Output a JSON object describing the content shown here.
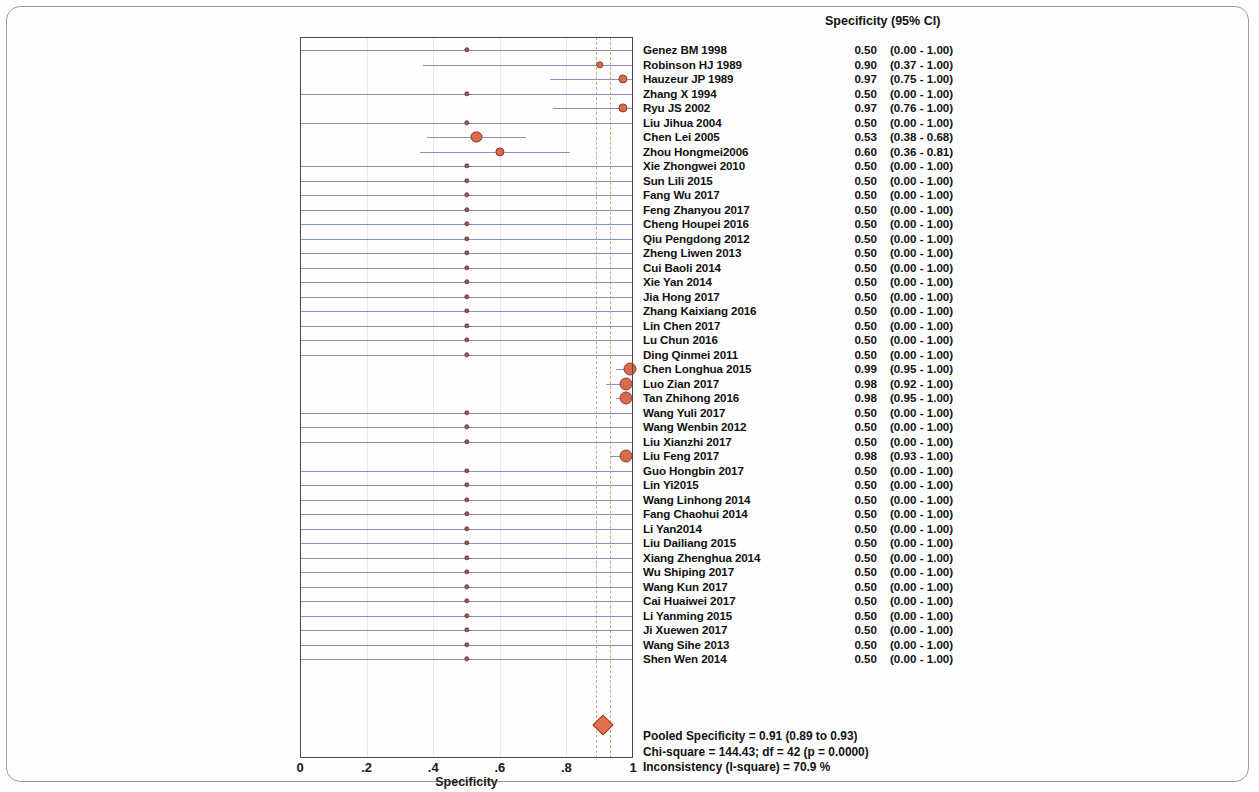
{
  "chart_data": {
    "type": "forest",
    "title": "",
    "xlabel": "Specificity",
    "ylabel": "",
    "xlim": [
      0,
      1
    ],
    "x_ticks": [
      "0",
      ".2",
      ".4",
      ".6",
      ".8",
      "1"
    ],
    "x_tick_values": [
      0,
      0.2,
      0.4,
      0.6,
      0.8,
      1
    ],
    "grid": false,
    "legend": "none",
    "column_header": "Specificity (95% CI)",
    "pooled_estimate": 0.91,
    "pooled_ci": [
      0.89,
      0.93
    ],
    "studies": [
      {
        "name": "Genez BM 1998",
        "est": "0.50",
        "ci": "(0.00 - 1.00)",
        "value": 0.5,
        "low": 0.0,
        "high": 1.0,
        "weight": 1
      },
      {
        "name": "Robinson HJ 1989",
        "est": "0.90",
        "ci": "(0.37 - 1.00)",
        "value": 0.9,
        "low": 0.37,
        "high": 1.0,
        "weight": 2
      },
      {
        "name": "Hauzeur JP 1989",
        "est": "0.97",
        "ci": "(0.75 - 1.00)",
        "value": 0.97,
        "low": 0.75,
        "high": 1.0,
        "weight": 3
      },
      {
        "name": "Zhang X 1994",
        "est": "0.50",
        "ci": "(0.00 - 1.00)",
        "value": 0.5,
        "low": 0.0,
        "high": 1.0,
        "weight": 1
      },
      {
        "name": "Ryu JS 2002",
        "est": "0.97",
        "ci": "(0.76 - 1.00)",
        "value": 0.97,
        "low": 0.76,
        "high": 1.0,
        "weight": 3
      },
      {
        "name": "Liu Jihua 2004",
        "est": "0.50",
        "ci": "(0.00 - 1.00)",
        "value": 0.5,
        "low": 0.0,
        "high": 1.0,
        "weight": 1
      },
      {
        "name": "Chen Lei 2005",
        "est": "0.53",
        "ci": "(0.38 - 0.68)",
        "value": 0.53,
        "low": 0.38,
        "high": 0.68,
        "weight": 4
      },
      {
        "name": "Zhou Hongmei2006",
        "est": "0.60",
        "ci": "(0.36 - 0.81)",
        "value": 0.6,
        "low": 0.36,
        "high": 0.81,
        "weight": 3
      },
      {
        "name": "Xie Zhongwei 2010",
        "est": "0.50",
        "ci": "(0.00 - 1.00)",
        "value": 0.5,
        "low": 0.0,
        "high": 1.0,
        "weight": 1
      },
      {
        "name": "Sun Lili 2015",
        "est": "0.50",
        "ci": "(0.00 - 1.00)",
        "value": 0.5,
        "low": 0.0,
        "high": 1.0,
        "weight": 1
      },
      {
        "name": "Fang Wu 2017",
        "est": "0.50",
        "ci": "(0.00 - 1.00)",
        "value": 0.5,
        "low": 0.0,
        "high": 1.0,
        "weight": 1
      },
      {
        "name": "Feng Zhanyou 2017",
        "est": "0.50",
        "ci": "(0.00 - 1.00)",
        "value": 0.5,
        "low": 0.0,
        "high": 1.0,
        "weight": 1
      },
      {
        "name": "Cheng Houpei 2016",
        "est": "0.50",
        "ci": "(0.00 - 1.00)",
        "value": 0.5,
        "low": 0.0,
        "high": 1.0,
        "weight": 1
      },
      {
        "name": "Qiu Pengdong 2012",
        "est": "0.50",
        "ci": "(0.00 - 1.00)",
        "value": 0.5,
        "low": 0.0,
        "high": 1.0,
        "weight": 1
      },
      {
        "name": "Zheng Liwen 2013",
        "est": "0.50",
        "ci": "(0.00 - 1.00)",
        "value": 0.5,
        "low": 0.0,
        "high": 1.0,
        "weight": 1
      },
      {
        "name": "Cui Baoli 2014",
        "est": "0.50",
        "ci": "(0.00 - 1.00)",
        "value": 0.5,
        "low": 0.0,
        "high": 1.0,
        "weight": 1
      },
      {
        "name": "Xie Yan 2014",
        "est": "0.50",
        "ci": "(0.00 - 1.00)",
        "value": 0.5,
        "low": 0.0,
        "high": 1.0,
        "weight": 1
      },
      {
        "name": "Jia Hong 2017",
        "est": "0.50",
        "ci": "(0.00 - 1.00)",
        "value": 0.5,
        "low": 0.0,
        "high": 1.0,
        "weight": 1
      },
      {
        "name": "Zhang Kaixiang 2016",
        "est": "0.50",
        "ci": "(0.00 - 1.00)",
        "value": 0.5,
        "low": 0.0,
        "high": 1.0,
        "weight": 1
      },
      {
        "name": "Lin Chen 2017",
        "est": "0.50",
        "ci": "(0.00 - 1.00)",
        "value": 0.5,
        "low": 0.0,
        "high": 1.0,
        "weight": 1
      },
      {
        "name": "Lu Chun 2016",
        "est": "0.50",
        "ci": "(0.00 - 1.00)",
        "value": 0.5,
        "low": 0.0,
        "high": 1.0,
        "weight": 1
      },
      {
        "name": "Ding Qinmei 2011",
        "est": "0.50",
        "ci": "(0.00 - 1.00)",
        "value": 0.5,
        "low": 0.0,
        "high": 1.0,
        "weight": 1
      },
      {
        "name": "Chen Longhua 2015",
        "est": "0.99",
        "ci": "(0.95 - 1.00)",
        "value": 0.99,
        "low": 0.95,
        "high": 1.0,
        "weight": 5
      },
      {
        "name": "Luo Zian 2017",
        "est": "0.98",
        "ci": "(0.92 - 1.00)",
        "value": 0.98,
        "low": 0.92,
        "high": 1.0,
        "weight": 5
      },
      {
        "name": "Tan Zhihong 2016",
        "est": "0.98",
        "ci": "(0.95 - 1.00)",
        "value": 0.98,
        "low": 0.95,
        "high": 1.0,
        "weight": 5
      },
      {
        "name": "Wang Yuli 2017",
        "est": "0.50",
        "ci": "(0.00 - 1.00)",
        "value": 0.5,
        "low": 0.0,
        "high": 1.0,
        "weight": 1
      },
      {
        "name": "Wang Wenbin 2012",
        "est": "0.50",
        "ci": "(0.00 - 1.00)",
        "value": 0.5,
        "low": 0.0,
        "high": 1.0,
        "weight": 1
      },
      {
        "name": "Liu Xianzhi 2017",
        "est": "0.50",
        "ci": "(0.00 - 1.00)",
        "value": 0.5,
        "low": 0.0,
        "high": 1.0,
        "weight": 1
      },
      {
        "name": "Liu Feng 2017",
        "est": "0.98",
        "ci": "(0.93 - 1.00)",
        "value": 0.98,
        "low": 0.93,
        "high": 1.0,
        "weight": 5
      },
      {
        "name": "Guo Hongbin 2017",
        "est": "0.50",
        "ci": "(0.00 - 1.00)",
        "value": 0.5,
        "low": 0.0,
        "high": 1.0,
        "weight": 1
      },
      {
        "name": "Lin Yi2015",
        "est": "0.50",
        "ci": "(0.00 - 1.00)",
        "value": 0.5,
        "low": 0.0,
        "high": 1.0,
        "weight": 1
      },
      {
        "name": "Wang Linhong 2014",
        "est": "0.50",
        "ci": "(0.00 - 1.00)",
        "value": 0.5,
        "low": 0.0,
        "high": 1.0,
        "weight": 1
      },
      {
        "name": "Fang Chaohui 2014",
        "est": "0.50",
        "ci": "(0.00 - 1.00)",
        "value": 0.5,
        "low": 0.0,
        "high": 1.0,
        "weight": 1
      },
      {
        "name": "Li Yan2014",
        "est": "0.50",
        "ci": "(0.00 - 1.00)",
        "value": 0.5,
        "low": 0.0,
        "high": 1.0,
        "weight": 1
      },
      {
        "name": "Liu Dailiang 2015",
        "est": "0.50",
        "ci": "(0.00 - 1.00)",
        "value": 0.5,
        "low": 0.0,
        "high": 1.0,
        "weight": 1
      },
      {
        "name": "Xiang Zhenghua 2014",
        "est": "0.50",
        "ci": "(0.00 - 1.00)",
        "value": 0.5,
        "low": 0.0,
        "high": 1.0,
        "weight": 1
      },
      {
        "name": "Wu Shiping 2017",
        "est": "0.50",
        "ci": "(0.00 - 1.00)",
        "value": 0.5,
        "low": 0.0,
        "high": 1.0,
        "weight": 1
      },
      {
        "name": "Wang Kun 2017",
        "est": "0.50",
        "ci": "(0.00 - 1.00)",
        "value": 0.5,
        "low": 0.0,
        "high": 1.0,
        "weight": 1
      },
      {
        "name": "Cai Huaiwei 2017",
        "est": "0.50",
        "ci": "(0.00 - 1.00)",
        "value": 0.5,
        "low": 0.0,
        "high": 1.0,
        "weight": 1
      },
      {
        "name": "Li Yanming 2015",
        "est": "0.50",
        "ci": "(0.00 - 1.00)",
        "value": 0.5,
        "low": 0.0,
        "high": 1.0,
        "weight": 1
      },
      {
        "name": "Ji Xuewen 2017",
        "est": "0.50",
        "ci": "(0.00 - 1.00)",
        "value": 0.5,
        "low": 0.0,
        "high": 1.0,
        "weight": 1
      },
      {
        "name": "Wang Sihe 2013",
        "est": "0.50",
        "ci": "(0.00 - 1.00)",
        "value": 0.5,
        "low": 0.0,
        "high": 1.0,
        "weight": 1
      },
      {
        "name": "Shen Wen 2014",
        "est": "0.50",
        "ci": "(0.00 - 1.00)",
        "value": 0.5,
        "low": 0.0,
        "high": 1.0,
        "weight": 1
      }
    ],
    "summary_lines": [
      "Pooled Specificity = 0.91 (0.89 to 0.93)",
      "Chi-square = 144.43; df =  42 (p = 0.0000)",
      "Inconsistency (I-square) = 70.9 %"
    ],
    "colors": {
      "marker": "#d96a50",
      "marker_small": "#8a5a58",
      "ci_line": "#8a8fc4",
      "pooled_dashed": "#e2a07a",
      "diamond": "#e0704e",
      "frame": "#4a4a4a",
      "text": "#111111"
    }
  }
}
